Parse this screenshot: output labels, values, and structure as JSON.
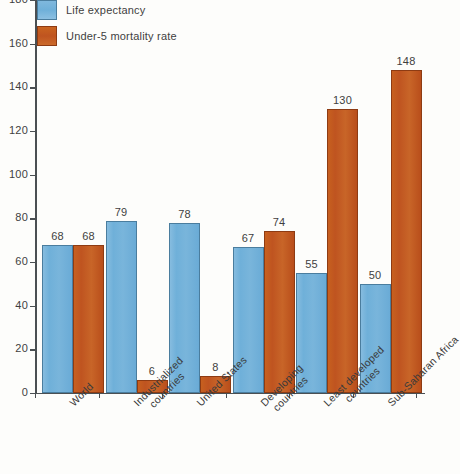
{
  "chart_data": {
    "type": "bar",
    "title": "",
    "xlabel": "",
    "ylabel": "",
    "ylim": [
      0,
      180
    ],
    "ytick_step": 20,
    "yticks": [
      "0",
      "20",
      "40",
      "60",
      "80",
      "100",
      "120",
      "140",
      "160",
      "180"
    ],
    "grid": false,
    "legend_position": "top-left",
    "categories": [
      "World",
      "Industrialized countries",
      "United States",
      "Developing countries",
      "Least developed countries",
      "Sub-Saharan Africa"
    ],
    "category_lines": [
      [
        "World"
      ],
      [
        "Industrialized",
        "countries"
      ],
      [
        "United States"
      ],
      [
        "Developing",
        "countries"
      ],
      [
        "Least developed",
        "countries"
      ],
      [
        "Sub-Saharan Africa"
      ]
    ],
    "series": [
      {
        "name": "Life expectancy",
        "color": "#6fb0d9",
        "values": [
          68,
          79,
          78,
          67,
          55,
          50
        ],
        "labels": [
          "68",
          "79",
          "78",
          "67",
          "55",
          "50"
        ]
      },
      {
        "name": "Under-5 mortality rate",
        "color": "#bf5420",
        "values": [
          68,
          6,
          8,
          74,
          130,
          148
        ],
        "labels": [
          "68",
          "6",
          "8",
          "74",
          "130",
          "148"
        ]
      }
    ]
  },
  "legend": {
    "items": [
      {
        "label": "Life expectancy",
        "swatch": "blue"
      },
      {
        "label": "Under-5 mortality rate",
        "swatch": "orange"
      }
    ]
  },
  "colors": {
    "series_blue": "#6fb0d9",
    "series_orange": "#bf5420",
    "axis": "#4a4f52",
    "text": "#3f3f3f",
    "background": "#fdfdfb"
  }
}
